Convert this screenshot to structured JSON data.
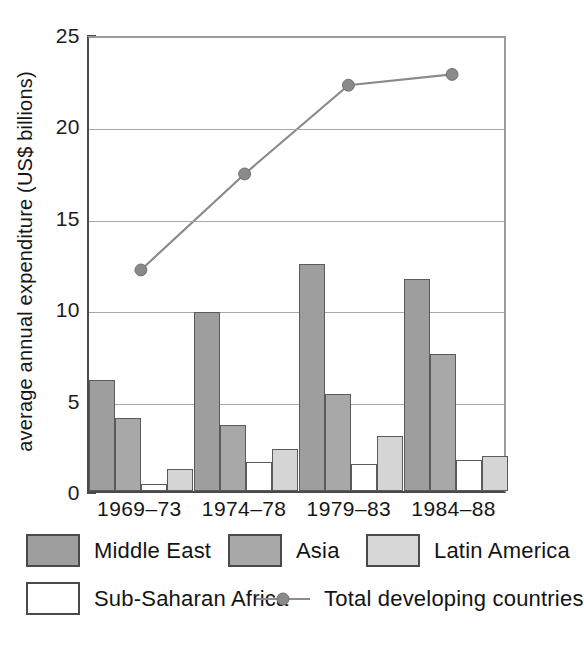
{
  "chart_data": {
    "type": "bar",
    "title": "",
    "xlabel": "",
    "ylabel": "average annual expenditure (US$ billions)",
    "categories": [
      "1969–73",
      "1974–78",
      "1979–83",
      "1984–88"
    ],
    "ylim": [
      0,
      25
    ],
    "yticks": [
      0,
      5,
      10,
      15,
      20,
      25
    ],
    "ytick_labels": [
      "0",
      "5",
      "10",
      "15",
      "20",
      "25"
    ],
    "grid": true,
    "legend_position": "below",
    "series": [
      {
        "name": "Middle East",
        "kind": "bar",
        "color": "#9e9e9e",
        "values": [
          6.1,
          9.8,
          12.4,
          11.6
        ]
      },
      {
        "name": "Asia",
        "kind": "bar",
        "color": "#a8a8a8",
        "values": [
          4.0,
          3.6,
          5.3,
          7.5
        ]
      },
      {
        "name": "Sub-Saharan Africa",
        "kind": "bar",
        "color": "#ffffff",
        "values": [
          0.4,
          1.6,
          1.5,
          1.7
        ]
      },
      {
        "name": "Latin America",
        "kind": "bar",
        "color": "#d5d5d5",
        "values": [
          1.2,
          2.3,
          3.0,
          1.9
        ]
      },
      {
        "name": "Total developing countries",
        "kind": "line",
        "color": "#8a8a8a",
        "values": [
          12.2,
          17.5,
          22.4,
          23.0
        ]
      }
    ]
  },
  "axis": {
    "y_title": "average annual expenditure (US$ billions)",
    "tick_labels": [
      "25",
      "20",
      "15",
      "10",
      "5",
      "0"
    ],
    "category_labels": [
      "1969–73",
      "1974–78",
      "1979–83",
      "1984–88"
    ]
  },
  "legend": {
    "row1": [
      {
        "label": "Middle East",
        "swatch": "me",
        "icon": "legend-swatch-middle-east"
      },
      {
        "label": "Asia",
        "swatch": "asia",
        "icon": "legend-swatch-asia"
      },
      {
        "label": "Latin America",
        "swatch": "la",
        "icon": "legend-swatch-latin-america"
      }
    ],
    "row2": [
      {
        "label": "Sub-Saharan Africa",
        "swatch": "ssa",
        "icon": "legend-swatch-sub-saharan-africa"
      },
      {
        "label": "Total developing countries",
        "swatch": "line",
        "icon": "legend-line-marker-total-developing"
      }
    ]
  },
  "colors": {
    "middle_east": "#9e9e9e",
    "asia": "#a8a8a8",
    "sub_saharan_africa": "#ffffff",
    "latin_america": "#d5d5d5",
    "total_line": "#8a8a8a",
    "axis": "#4a4a4a",
    "grid": "#a8a8a8"
  }
}
